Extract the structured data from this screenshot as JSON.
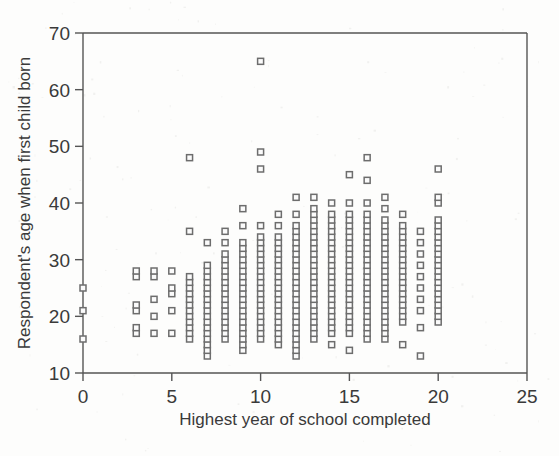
{
  "chart_data": {
    "type": "scatter",
    "title": "",
    "xlabel": "Highest year of school completed",
    "ylabel": "Respondent's age when first child born",
    "xlim": [
      0,
      25
    ],
    "ylim": [
      10,
      70
    ],
    "xticks": [
      0,
      5,
      10,
      15,
      20,
      25
    ],
    "yticks": [
      10,
      20,
      30,
      40,
      50,
      60,
      70
    ],
    "xtick_labels": [
      "0",
      "5",
      "10",
      "15",
      "20",
      "25"
    ],
    "ytick_labels": [
      "10",
      "20",
      "30",
      "40",
      "50",
      "60",
      "70"
    ],
    "grid": false,
    "legend": null,
    "marker": "open-square",
    "marker_color": "#6d6d6d",
    "columns": [
      {
        "x": 0,
        "y": [
          16,
          21,
          25
        ]
      },
      {
        "x": 3,
        "y": [
          17,
          18,
          21,
          22,
          27,
          28
        ]
      },
      {
        "x": 4,
        "y": [
          17,
          20,
          23,
          27,
          28
        ]
      },
      {
        "x": 5,
        "y": [
          17,
          21,
          24,
          25,
          28
        ]
      },
      {
        "x": 6,
        "y": [
          16,
          17,
          18,
          19,
          20,
          21,
          22,
          23,
          24,
          25,
          26,
          27,
          35,
          48
        ]
      },
      {
        "x": 7,
        "y": [
          13,
          14,
          15,
          16,
          17,
          18,
          19,
          20,
          21,
          22,
          23,
          24,
          25,
          26,
          27,
          28,
          29,
          33
        ]
      },
      {
        "x": 8,
        "y": [
          16,
          17,
          18,
          19,
          20,
          21,
          22,
          23,
          24,
          25,
          26,
          27,
          28,
          29,
          30,
          31,
          33,
          35
        ]
      },
      {
        "x": 9,
        "y": [
          14,
          15,
          16,
          17,
          18,
          19,
          20,
          21,
          22,
          23,
          24,
          25,
          26,
          27,
          28,
          29,
          30,
          31,
          32,
          33,
          36,
          39
        ]
      },
      {
        "x": 10,
        "y": [
          16,
          17,
          18,
          19,
          20,
          21,
          22,
          23,
          24,
          25,
          26,
          27,
          28,
          29,
          30,
          31,
          32,
          33,
          34,
          36,
          46,
          49,
          65
        ]
      },
      {
        "x": 11,
        "y": [
          15,
          16,
          17,
          18,
          19,
          20,
          21,
          22,
          23,
          24,
          25,
          26,
          27,
          28,
          29,
          30,
          31,
          32,
          33,
          34,
          36,
          38
        ]
      },
      {
        "x": 12,
        "y": [
          13,
          14,
          15,
          16,
          17,
          18,
          19,
          20,
          21,
          22,
          23,
          24,
          25,
          26,
          27,
          28,
          29,
          30,
          31,
          32,
          33,
          34,
          35,
          36,
          38,
          41
        ]
      },
      {
        "x": 13,
        "y": [
          16,
          17,
          18,
          19,
          20,
          21,
          22,
          23,
          24,
          25,
          26,
          27,
          28,
          29,
          30,
          31,
          32,
          33,
          34,
          35,
          36,
          37,
          38,
          39,
          41
        ]
      },
      {
        "x": 14,
        "y": [
          15,
          17,
          18,
          19,
          20,
          21,
          22,
          23,
          24,
          25,
          26,
          27,
          28,
          29,
          30,
          31,
          32,
          33,
          34,
          35,
          36,
          37,
          38,
          40
        ]
      },
      {
        "x": 15,
        "y": [
          14,
          17,
          18,
          19,
          20,
          21,
          22,
          23,
          24,
          25,
          26,
          27,
          28,
          29,
          30,
          31,
          32,
          33,
          34,
          35,
          36,
          37,
          38,
          40,
          45
        ]
      },
      {
        "x": 16,
        "y": [
          16,
          17,
          18,
          19,
          20,
          21,
          22,
          23,
          24,
          25,
          26,
          27,
          28,
          29,
          30,
          31,
          32,
          33,
          34,
          35,
          36,
          37,
          38,
          40,
          44,
          48
        ]
      },
      {
        "x": 17,
        "y": [
          16,
          17,
          18,
          19,
          20,
          21,
          22,
          23,
          24,
          25,
          26,
          27,
          28,
          29,
          30,
          31,
          32,
          33,
          34,
          35,
          36,
          37,
          39,
          41
        ]
      },
      {
        "x": 18,
        "y": [
          15,
          19,
          20,
          21,
          22,
          23,
          24,
          25,
          26,
          27,
          28,
          29,
          30,
          31,
          32,
          33,
          34,
          35,
          36,
          38
        ]
      },
      {
        "x": 19,
        "y": [
          13,
          18,
          21,
          23,
          25,
          27,
          29,
          31,
          33,
          35
        ]
      },
      {
        "x": 20,
        "y": [
          19,
          20,
          21,
          22,
          23,
          24,
          25,
          26,
          27,
          28,
          29,
          30,
          31,
          32,
          33,
          34,
          35,
          36,
          37,
          40,
          41,
          46
        ]
      }
    ]
  },
  "chart": {
    "xlabel": "Highest year of school completed",
    "ylabel": "Respondent's age when first child born"
  }
}
